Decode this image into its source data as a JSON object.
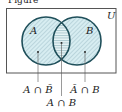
{
  "figure": {
    "caption_partial": "Figure",
    "universe_label": "U",
    "set_a_label": "A",
    "set_b_label": "B",
    "regions": [
      {
        "id": "a_only",
        "label": "A ∩ B̄"
      },
      {
        "id": "a_and_b",
        "label": "A ∩ B"
      },
      {
        "id": "b_only",
        "label": "Ā ∩ B"
      }
    ],
    "colors": {
      "circle_stroke": "#1f4f5a",
      "fill": "#d7edf1",
      "hatch": "#8fb3bb",
      "frame": "#555555"
    }
  }
}
